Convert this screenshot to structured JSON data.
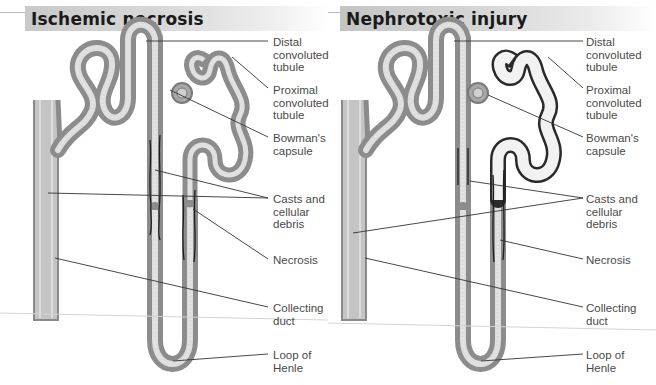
{
  "figure": {
    "panels": [
      {
        "title": "Ischemic necrosis",
        "labels": {
          "distal": "Distal\nconvoluted\ntubule",
          "proximal": "Proximal\nconvoluted\ntubule",
          "bowman": "Bowman's\ncapsule",
          "casts": "Casts and\ncellular\ndebris",
          "necrosis": "Necrosis",
          "collecting": "Collecting\nduct",
          "loop": "Loop of\nHenle"
        }
      },
      {
        "title": "Nephrotoxic injury",
        "labels": {
          "distal": "Distal\nconvoluted\ntubule",
          "proximal": "Proximal\nconvoluted\ntubule",
          "bowman": "Bowman's\ncapsule",
          "casts": "Casts and\ncellular\ndebris",
          "necrosis": "Necrosis",
          "collecting": "Collecting\nduct",
          "loop": "Loop of\nHenle"
        }
      }
    ],
    "colors": {
      "tubule_wall": "#8a8a8a",
      "tubule_lumen": "#e2e2e2",
      "necrosis_mark": "#1e1e1e",
      "leader_line": "#3a3a3a",
      "label_text": "#4a4a4a"
    }
  }
}
